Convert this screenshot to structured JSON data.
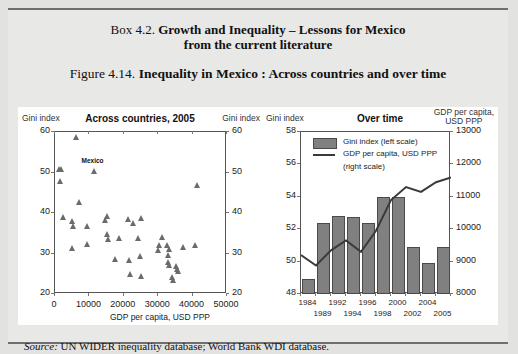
{
  "box": {
    "label": "Box 4.2.",
    "title_line1": "Growth and Inequality – Lessons for Mexico",
    "title_line2": "from the current literature"
  },
  "figure": {
    "label": "Figure 4.14.",
    "title": "Inequality in Mexico : Across countries and over time"
  },
  "source": {
    "label": "Source:",
    "text": "UN WIDER inequality database; World Bank WDI database."
  },
  "colors": {
    "marker": "#6b6b6b",
    "bar_fill": "#808080",
    "bar_stroke": "#4a4a4a",
    "line": "#3a3a3a",
    "panel_bg": "#ffffff",
    "page_bg": "#e8e8e6"
  },
  "chart_data": [
    {
      "type": "scatter",
      "title": "Across countries, 2005",
      "ylabel_left": "Gini index",
      "ylabel_right": "Gini index",
      "xlabel": "GDP per capita, USD PPP",
      "xlim": [
        0,
        50000
      ],
      "ylim": [
        20,
        60
      ],
      "xticks": [
        0,
        10000,
        20000,
        30000,
        40000,
        50000
      ],
      "xtick_labels": [
        "0",
        "10000",
        "20000",
        "30000",
        "40000",
        "50000"
      ],
      "yticks": [
        20,
        30,
        40,
        50,
        60
      ],
      "ytick_labels": [
        "20",
        "30",
        "40",
        "50",
        "60"
      ],
      "grid": false,
      "annotations": [
        {
          "text": "Mexico",
          "x": 11500,
          "y": 51.6
        }
      ],
      "points": [
        {
          "x": 6200,
          "y": 58.3
        },
        {
          "x": 1400,
          "y": 50.4
        },
        {
          "x": 2000,
          "y": 50.4
        },
        {
          "x": 11500,
          "y": 49.9
        },
        {
          "x": 1500,
          "y": 47.3
        },
        {
          "x": 41500,
          "y": 46.5
        },
        {
          "x": 7100,
          "y": 42.2
        },
        {
          "x": 2600,
          "y": 38.6
        },
        {
          "x": 15200,
          "y": 38.7
        },
        {
          "x": 21500,
          "y": 38.1
        },
        {
          "x": 25200,
          "y": 38.2
        },
        {
          "x": 5200,
          "y": 37.6
        },
        {
          "x": 14800,
          "y": 37.7
        },
        {
          "x": 22800,
          "y": 37.0
        },
        {
          "x": 5300,
          "y": 36.4
        },
        {
          "x": 9600,
          "y": 36.2
        },
        {
          "x": 15300,
          "y": 34.4
        },
        {
          "x": 15500,
          "y": 33.2
        },
        {
          "x": 18900,
          "y": 33.3
        },
        {
          "x": 24200,
          "y": 33.4
        },
        {
          "x": 31200,
          "y": 33.5
        },
        {
          "x": 9500,
          "y": 31.8
        },
        {
          "x": 5100,
          "y": 30.8
        },
        {
          "x": 30300,
          "y": 31.6
        },
        {
          "x": 32700,
          "y": 31.6
        },
        {
          "x": 37300,
          "y": 31.2
        },
        {
          "x": 41000,
          "y": 31.5
        },
        {
          "x": 33300,
          "y": 30.7
        },
        {
          "x": 30200,
          "y": 30.3
        },
        {
          "x": 17700,
          "y": 28.2
        },
        {
          "x": 21600,
          "y": 28.0
        },
        {
          "x": 25000,
          "y": 28.8
        },
        {
          "x": 32900,
          "y": 29.2
        },
        {
          "x": 33100,
          "y": 27.4
        },
        {
          "x": 33400,
          "y": 26.6
        },
        {
          "x": 35300,
          "y": 26.3
        },
        {
          "x": 35700,
          "y": 25.7
        },
        {
          "x": 36000,
          "y": 25.1
        },
        {
          "x": 22100,
          "y": 24.4
        },
        {
          "x": 25100,
          "y": 23.9
        },
        {
          "x": 34300,
          "y": 23.7
        },
        {
          "x": 34600,
          "y": 23.0
        }
      ]
    },
    {
      "type": "bar",
      "title": "Over time",
      "ylabel_left": "Gini index",
      "ylabel_right_line1": "GDP per capita,",
      "ylabel_right_line2": "USD PPP",
      "categories": [
        "1984",
        "1989",
        "1992",
        "1994",
        "1996",
        "1998",
        "2000",
        "2002",
        "2004",
        "2005"
      ],
      "xtick_labels_top": [
        "1984",
        "1992",
        "1996",
        "2000",
        "2004"
      ],
      "xtick_labels_bottom": [
        "1989",
        "1994",
        "1998",
        "2002",
        "2005"
      ],
      "ylim_left": [
        48,
        58
      ],
      "yticks_left": [
        48,
        50,
        52,
        54,
        56,
        58
      ],
      "ytick_labels_left": [
        "48",
        "50",
        "52",
        "54",
        "56",
        "58"
      ],
      "ylim_right": [
        8000,
        13000
      ],
      "yticks_right": [
        8000,
        9000,
        10000,
        11000,
        12000,
        13000
      ],
      "ytick_labels_right": [
        "8000",
        "9000",
        "10000",
        "11000",
        "12000",
        "13000"
      ],
      "grid": false,
      "legend_position": "top-left",
      "series": [
        {
          "name": "Gini index (left scale)",
          "kind": "bar",
          "axis": "left",
          "values": [
            48.9,
            52.4,
            52.8,
            52.75,
            52.4,
            54.0,
            54.0,
            50.9,
            49.9,
            50.9
          ]
        },
        {
          "name": "GDP per capita, USD PPP (right scale)",
          "kind": "line",
          "axis": "right",
          "values": [
            9200,
            8880,
            9350,
            9650,
            9300,
            9950,
            10900,
            11300,
            11150,
            11450,
            11600
          ]
        }
      ],
      "legend": [
        {
          "marker": "bar-swatch",
          "label": "Gini index (left scale)"
        },
        {
          "marker": "line-swatch",
          "label": "GDP per capita, USD PPP"
        },
        {
          "marker": "none",
          "label": "(right scale)"
        }
      ]
    }
  ]
}
